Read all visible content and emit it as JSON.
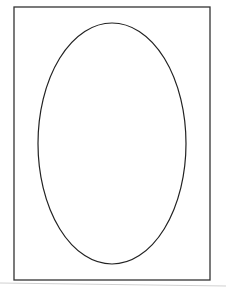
{
  "canvas": {
    "width": 226,
    "height": 290,
    "background": "#ffffff"
  },
  "shapes": {
    "frame": {
      "type": "rectangle",
      "x": 14,
      "y": 7,
      "width": 196,
      "height": 273,
      "stroke": "#333333",
      "stroke_width": 1.3,
      "fill": "none"
    },
    "ellipse": {
      "type": "ellipse",
      "cx": 112,
      "cy": 143.5,
      "rx": 74,
      "ry": 120.5,
      "stroke": "#222222",
      "stroke_width": 1.2,
      "fill": "none"
    },
    "shadow_line": {
      "type": "line",
      "x1": 0,
      "y1": 283,
      "x2": 226,
      "y2": 286,
      "stroke": "#d0d0d0",
      "stroke_width": 1
    }
  }
}
